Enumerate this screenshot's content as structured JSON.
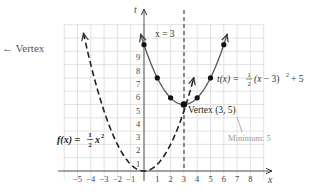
{
  "annotations": {
    "vertex_arrow_label": "Vertex",
    "axis_of_symmetry": "x = 3",
    "vertex_point": "Vertex (3, 5)",
    "minimum": "Minimum: 5",
    "f_label": "f(x) = ½x²",
    "t_label": "t(x) = ½(x − 3)² + 5"
  },
  "axes": {
    "x_label": "x",
    "y_label": "t",
    "x_ticks": [
      "−5",
      "−4",
      "−3",
      "−2",
      "−1",
      "1",
      "2",
      "3",
      "4",
      "5",
      "6",
      "7",
      "8"
    ],
    "y_ticks": [
      "1",
      "2",
      "3",
      "4",
      "5",
      "6",
      "7",
      "8",
      "9"
    ]
  },
  "colors": {
    "grid": "#d9d9d9",
    "curve": "#444444",
    "axis": "#555555",
    "minimum_label": "#999999"
  },
  "chart_data": {
    "type": "line",
    "title": "",
    "xlabel": "x",
    "ylabel": "t",
    "xlim": [
      -6,
      9
    ],
    "ylim": [
      0,
      11
    ],
    "grid": true,
    "series": [
      {
        "name": "f(x) = 1/2 x^2",
        "style": "dashed",
        "x": [
          -4.6,
          -4,
          -3,
          -2,
          -1,
          0,
          1,
          2,
          3,
          3.8
        ],
        "y": [
          10.58,
          8,
          4.5,
          2,
          0.5,
          0,
          0.5,
          2,
          4.5,
          7.22
        ]
      },
      {
        "name": "t(x) = 1/2 (x - 3)^2 + 5",
        "style": "solid",
        "x": [
          -0.3,
          0,
          1,
          2,
          3,
          4,
          5,
          6,
          7.5
        ],
        "y": [
          10.45,
          9.5,
          7,
          5.5,
          5,
          5.5,
          7,
          9.5,
          15.1
        ],
        "marked_points": [
          [
            0,
            9.5
          ],
          [
            1,
            7
          ],
          [
            2,
            5.5
          ],
          [
            3,
            5
          ],
          [
            4,
            5.5
          ],
          [
            5,
            7
          ],
          [
            6,
            9.5
          ]
        ]
      },
      {
        "name": "x = 3",
        "style": "dashed-vertical",
        "x": [
          3,
          3
        ],
        "y": [
          0,
          11
        ]
      }
    ],
    "annotations": [
      "x = 3",
      "Vertex (3, 5)",
      "Minimum: 5",
      "f(x) = 1/2 x^2",
      "t(x) = 1/2 (x − 3)^2 + 5",
      "← Vertex"
    ]
  }
}
